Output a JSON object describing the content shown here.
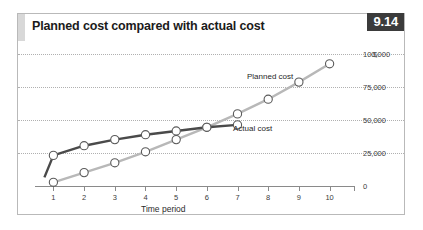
{
  "figure": {
    "title": "Planned cost compared with actual cost",
    "badge": "9.14",
    "currency_symbol": "$"
  },
  "chart_data": {
    "type": "line",
    "title": "Planned cost compared with actual cost",
    "xlabel": "Time period",
    "ylabel": "$",
    "x": [
      1,
      2,
      3,
      4,
      5,
      6,
      7,
      8,
      9,
      10
    ],
    "categories": [
      "1",
      "2",
      "3",
      "4",
      "5",
      "6",
      "7",
      "8",
      "9",
      "10"
    ],
    "xlim": [
      0.4,
      10.6
    ],
    "ylim": [
      0,
      108000
    ],
    "yticks": [
      0,
      25000,
      50000,
      75000,
      100000
    ],
    "ytick_labels": [
      "0",
      "25,000",
      "50,000",
      "75,000",
      "100,000"
    ],
    "grid": true,
    "legend": "inline-annotations",
    "series": [
      {
        "name": "Planned cost",
        "color": "#b8b8b8",
        "values": [
          3000,
          11000,
          19000,
          28000,
          38000,
          48000,
          59000,
          71000,
          85000,
          100000
        ]
      },
      {
        "name": "Actual cost",
        "color": "#4a4a4a",
        "values": [
          25000,
          33000,
          38000,
          42000,
          45000,
          48000,
          50000,
          null,
          null,
          null
        ]
      }
    ],
    "annotations": [
      {
        "text": "Planned cost",
        "x": 7.3,
        "y": 70000
      },
      {
        "text": "Actual cost",
        "x": 6.4,
        "y": 44000
      }
    ]
  },
  "axis": {
    "x_tick_labels": [
      "1",
      "2",
      "3",
      "4",
      "5",
      "6",
      "7",
      "8",
      "9",
      "10"
    ],
    "y_tick_labels": [
      "100,000",
      "75,000",
      "50,000",
      "25,000",
      "0"
    ]
  }
}
